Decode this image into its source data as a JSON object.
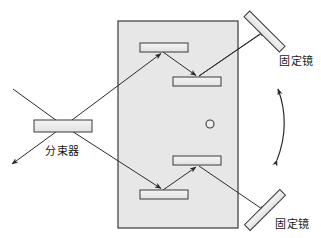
{
  "figure": {
    "type": "optical-interferometer-schematic",
    "background_color": "#ffffff",
    "stroke_color": "#333333",
    "component_fill": "#ededed",
    "housing_fill": "#e6e6e6",
    "width": 321,
    "height": 238
  },
  "labels": {
    "beam_splitter": "分束器",
    "fixed_mirror_top": "固定镜",
    "fixed_mirror_bottom": "固定镜"
  },
  "components": {
    "housing": {
      "name": "rotating-mirror-assembly-housing",
      "x": 118,
      "y": 21,
      "width": 120,
      "height": 207
    },
    "beam_splitter": {
      "name": "beam-splitter",
      "x": 34,
      "y": 120,
      "width": 58,
      "height": 12
    },
    "pivot_dot": {
      "name": "rotation-pivot",
      "cx": 210,
      "cy": 124,
      "r": 4
    },
    "internal_mirrors": [
      {
        "name": "upper-left-mirror",
        "x": 140,
        "y": 43,
        "width": 48,
        "height": 9
      },
      {
        "name": "upper-right-mirror",
        "x": 173,
        "y": 77,
        "width": 48,
        "height": 9
      },
      {
        "name": "lower-right-mirror",
        "x": 173,
        "y": 156,
        "width": 48,
        "height": 9
      },
      {
        "name": "lower-left-mirror",
        "x": 140,
        "y": 190,
        "width": 48,
        "height": 9
      }
    ],
    "fixed_mirrors": [
      {
        "name": "fixed-mirror-top",
        "x1": 248,
        "y1": 15,
        "x2": 281,
        "y2": 48
      },
      {
        "name": "fixed-mirror-bottom",
        "x1": 249,
        "y1": 226,
        "x2": 281,
        "y2": 194
      }
    ]
  },
  "beams": {
    "input_beam": {
      "name": "input-beam",
      "from": [
        13,
        89
      ],
      "to": [
        64,
        126
      ]
    },
    "output_beam": {
      "name": "output-beam",
      "from": [
        64,
        126
      ],
      "to": [
        12,
        164
      ]
    },
    "upper_path": [
      {
        "name": "beam-splitter-to-upper-left-mirror",
        "from": [
          64,
          126
        ],
        "to": [
          163,
          52
        ]
      },
      {
        "name": "upper-left-to-upper-right-mirror",
        "from": [
          163,
          52
        ],
        "to": [
          197,
          77
        ]
      },
      {
        "name": "upper-right-mirror-to-fixed-top",
        "from": [
          197,
          77
        ],
        "to": [
          264,
          31
        ]
      }
    ],
    "lower_path": [
      {
        "name": "beam-splitter-to-lower-left-mirror",
        "from": [
          64,
          126
        ],
        "to": [
          163,
          190
        ]
      },
      {
        "name": "lower-left-to-lower-right-mirror",
        "from": [
          163,
          190
        ],
        "to": [
          197,
          165
        ]
      },
      {
        "name": "lower-right-mirror-to-fixed-bottom",
        "from": [
          197,
          165
        ],
        "to": [
          264,
          211
        ]
      }
    ],
    "rotation_arrow": {
      "name": "rotation-direction-arrow",
      "from": [
        277,
        161
      ],
      "to": [
        277,
        88
      ],
      "control": [
        292,
        125
      ]
    }
  }
}
